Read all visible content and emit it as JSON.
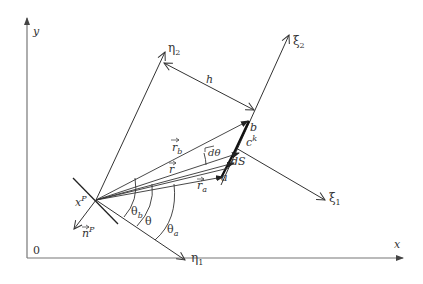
{
  "diagram": {
    "type": "geometry-schematic",
    "axes": {
      "x_label": "x",
      "y_label": "y",
      "origin_label": "0"
    },
    "source_point": {
      "label": "x",
      "superscript": "P"
    },
    "normal": {
      "label": "n",
      "superscript": "P"
    },
    "local_axes_source": {
      "eta1": "η",
      "eta1_sub": "1",
      "eta2": "η",
      "eta2_sub": "2"
    },
    "local_axes_element": {
      "xi1": "ξ",
      "xi1_sub": "1",
      "xi2": "ξ",
      "xi2_sub": "2"
    },
    "distance_label": "h",
    "element": {
      "label": "c",
      "superscript": "k",
      "end_a": "a",
      "end_b": "b",
      "ds_label": "dS"
    },
    "vectors": {
      "r": "r",
      "r_a": "r",
      "r_a_sub": "a",
      "r_b": "r",
      "r_b_sub": "b"
    },
    "angles": {
      "theta": "θ",
      "theta_a": "θ",
      "theta_a_sub": "a",
      "theta_b": "θ",
      "theta_b_sub": "b",
      "d_theta": "dθ"
    },
    "colors": {
      "line": "#333333",
      "axis": "#666666",
      "background": "#ffffff"
    }
  }
}
